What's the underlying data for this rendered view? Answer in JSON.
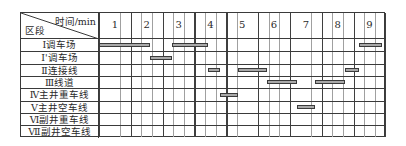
{
  "chart_data": {
    "type": "bar",
    "orientation": "horizontal-gantt",
    "title": "",
    "xlabel": "时间/min",
    "ylabel": "区段",
    "x_ticks": [
      "1",
      "2",
      "3",
      "4",
      "5",
      "6",
      "7",
      "8",
      "9"
    ],
    "xlim": [
      0,
      9
    ],
    "minor_divisions_per_minute": 3,
    "grid": true,
    "categories": [
      "Ⅰ调车场",
      "Ⅰ'调车场",
      "Ⅱ连接线",
      "Ⅲ线道",
      "Ⅳ主井重车线",
      "Ⅴ主井空车线",
      "Ⅵ副井重车线",
      "Ⅶ副井空车线"
    ],
    "tasks": [
      {
        "row_index": 0,
        "label": "Ⅰ调车场",
        "start": 0.0,
        "end": 1.6
      },
      {
        "row_index": 1,
        "label": "Ⅰ'调车场",
        "start": 1.6,
        "end": 2.28
      },
      {
        "row_index": 0,
        "label": "Ⅰ调车场",
        "start": 2.28,
        "end": 3.42
      },
      {
        "row_index": 2,
        "label": "Ⅱ连接线",
        "start": 3.42,
        "end": 3.8
      },
      {
        "row_index": 4,
        "label": "Ⅳ主井重车线",
        "start": 3.8,
        "end": 4.37
      },
      {
        "row_index": 2,
        "label": "Ⅱ连接线",
        "start": 4.37,
        "end": 5.28
      },
      {
        "row_index": 3,
        "label": "Ⅲ线道",
        "start": 5.28,
        "end": 6.23
      },
      {
        "row_index": 5,
        "label": "Ⅴ主井空车线",
        "start": 6.23,
        "end": 6.78
      },
      {
        "row_index": 3,
        "label": "Ⅲ线道",
        "start": 6.78,
        "end": 7.72
      },
      {
        "row_index": 2,
        "label": "Ⅱ连接线",
        "start": 7.72,
        "end": 8.18
      },
      {
        "row_index": 0,
        "label": "Ⅰ调车场",
        "start": 8.18,
        "end": 8.9
      }
    ],
    "colors": {
      "bar_fill": "#a9a9a9",
      "bar_border": "#3a3a3a",
      "major_grid": "#3f3f3f",
      "minor_grid": "#a0a0a0"
    }
  }
}
